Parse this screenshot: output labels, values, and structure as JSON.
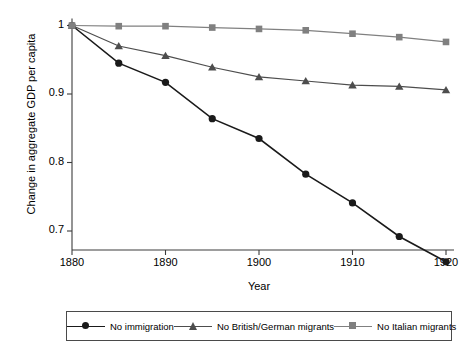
{
  "chart_data": {
    "type": "line",
    "title": "",
    "xlabel": "Year",
    "ylabel": "Change in aggregate GDP per capita",
    "xlim": [
      1880,
      1920
    ],
    "ylim": [
      0.67,
      1.005
    ],
    "xticks": [
      1880,
      1890,
      1900,
      1910,
      1920
    ],
    "yticks": [
      0.7,
      0.8,
      0.9,
      1
    ],
    "ytick_labels": [
      "0.7",
      "0.8",
      "0.9",
      "1"
    ],
    "xtick_labels": [
      "1880",
      "1890",
      "1900",
      "1910",
      "1920"
    ],
    "grid": false,
    "legend_position": "below",
    "x": [
      1880,
      1885,
      1890,
      1895,
      1900,
      1905,
      1910,
      1915,
      1920
    ],
    "series": [
      {
        "name": "No immigration",
        "marker": "circle",
        "color": "#1a1a1a",
        "values": [
          1.0,
          0.945,
          0.917,
          0.864,
          0.835,
          0.783,
          0.741,
          0.692,
          0.655
        ]
      },
      {
        "name": "No British/German migrants",
        "marker": "triangle",
        "color": "#4d4d4d",
        "values": [
          1.0,
          0.97,
          0.956,
          0.939,
          0.925,
          0.919,
          0.913,
          0.911,
          0.906
        ]
      },
      {
        "name": "No Italian migrants",
        "marker": "square",
        "color": "#808080",
        "values": [
          1.0,
          0.999,
          0.999,
          0.997,
          0.995,
          0.993,
          0.988,
          0.983,
          0.976
        ]
      }
    ]
  },
  "legend": {
    "entries": [
      {
        "label": "No immigration",
        "marker": "circle-marker",
        "color": "#1a1a1a"
      },
      {
        "label": "No British/German migrants",
        "marker": "triangle-marker",
        "color": "#4d4d4d"
      },
      {
        "label": "No Italian migrants",
        "marker": "square-marker",
        "color": "#808080"
      }
    ]
  },
  "axes": {
    "axis_color": "#3c3c3c",
    "ylabel": "Change in aggregate GDP per capita",
    "xlabel": "Year"
  }
}
